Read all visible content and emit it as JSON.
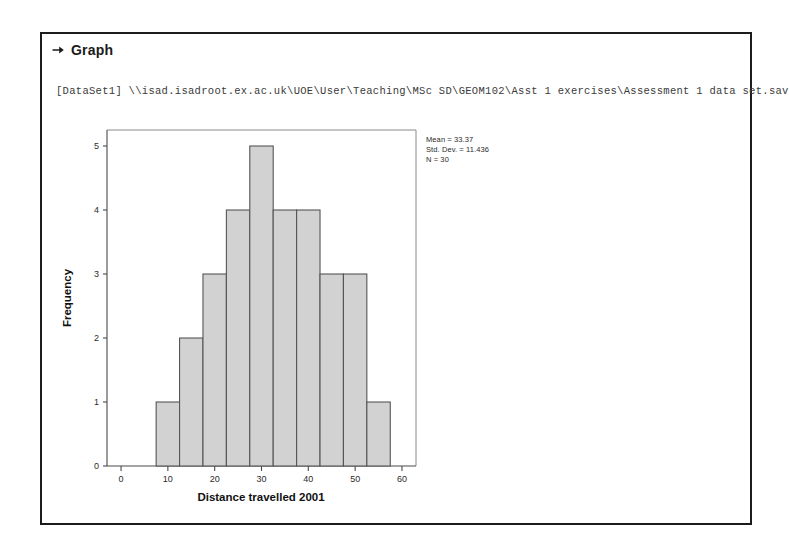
{
  "window": {
    "background_color": "#ffffff",
    "frame_border_color": "#1c1c1c"
  },
  "header": {
    "marker_icon": "right-arrow-icon",
    "title": "Graph"
  },
  "dataset": {
    "line": "[DataSet1] \\\\isad.isadroot.ex.ac.uk\\UOE\\User\\Teaching\\MSc SD\\GEOM102\\Asst 1 exercises\\Assessment 1 data set.sav"
  },
  "statistics": {
    "mean_label": "Mean = 33.37",
    "std_dev_label": "Std. Dev. = 11.436",
    "n_label": "N = 30"
  },
  "chart_data": {
    "type": "bar",
    "subtype": "histogram",
    "title": "",
    "xlabel": "Distance travelled 2001",
    "ylabel": "Frequency",
    "xlim": [
      -3,
      63
    ],
    "ylim": [
      0,
      5.25
    ],
    "xticks": [
      0,
      10,
      20,
      30,
      40,
      50,
      60
    ],
    "xtick_labels": [
      "0",
      "10",
      "20",
      "30",
      "40",
      "50",
      "60"
    ],
    "yticks": [
      0,
      1,
      2,
      3,
      4,
      5
    ],
    "ytick_labels": [
      "0",
      "1",
      "2",
      "3",
      "4",
      "5"
    ],
    "grid": false,
    "legend": false,
    "bin_width": 5,
    "bin_edges": [
      7.5,
      12.5,
      17.5,
      22.5,
      27.5,
      32.5,
      37.5,
      42.5,
      47.5,
      52.5,
      57.5
    ],
    "categories": [
      "7.5-12.5",
      "12.5-17.5",
      "17.5-22.5",
      "22.5-27.5",
      "27.5-32.5",
      "32.5-37.5",
      "37.5-42.5",
      "42.5-47.5",
      "47.5-52.5",
      "52.5-57.5"
    ],
    "values": [
      1,
      2,
      3,
      4,
      5,
      4,
      4,
      3,
      3,
      1
    ],
    "bar_fill_color": "#d2d2d2",
    "bar_edge_color": "#555555",
    "annotations": [
      "Mean = 33.37",
      "Std. Dev. = 11.436",
      "N = 30"
    ],
    "total_count": 30,
    "mean": 33.37,
    "std_dev": 11.436,
    "n": 30
  }
}
